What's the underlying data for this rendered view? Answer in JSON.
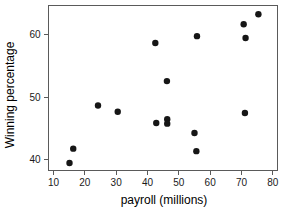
{
  "chart_data": {
    "type": "scatter",
    "title": "",
    "xlabel": "payroll (millions)",
    "ylabel": "Winning percentage",
    "xlim": [
      8.4,
      81.5
    ],
    "ylim": [
      38.3,
      64.7
    ],
    "xticks": [
      10,
      20,
      30,
      40,
      50,
      60,
      70,
      80
    ],
    "xtick_labels": [
      "10",
      "20",
      "30",
      "40",
      "50",
      "60",
      "70",
      "80"
    ],
    "yticks": [
      40,
      50,
      60
    ],
    "ytick_labels": [
      "40",
      "50",
      "60"
    ],
    "grid": false,
    "legend": null,
    "marker": "filled-circle",
    "marker_color": "#161616",
    "frame_color": "#5a5a5a",
    "x": [
      15.1,
      16.3,
      24.2,
      30.5,
      42.5,
      42.8,
      46.2,
      46.3,
      46.3,
      55.0,
      55.6,
      55.8,
      70.7,
      71.1,
      71.3,
      75.4
    ],
    "y": [
      39.5,
      41.8,
      48.7,
      47.7,
      58.7,
      45.9,
      52.6,
      46.5,
      45.8,
      44.3,
      41.4,
      59.8,
      61.7,
      47.5,
      59.5,
      63.3
    ],
    "points": [
      {
        "x": 15.1,
        "y": 39.5
      },
      {
        "x": 16.3,
        "y": 41.8
      },
      {
        "x": 24.2,
        "y": 48.7
      },
      {
        "x": 30.5,
        "y": 47.7
      },
      {
        "x": 42.5,
        "y": 58.7
      },
      {
        "x": 42.8,
        "y": 45.9
      },
      {
        "x": 46.2,
        "y": 52.6
      },
      {
        "x": 46.3,
        "y": 46.5
      },
      {
        "x": 46.3,
        "y": 45.8
      },
      {
        "x": 55.0,
        "y": 44.3
      },
      {
        "x": 55.6,
        "y": 41.4
      },
      {
        "x": 55.8,
        "y": 59.8
      },
      {
        "x": 70.7,
        "y": 61.7
      },
      {
        "x": 71.1,
        "y": 47.5
      },
      {
        "x": 71.3,
        "y": 59.5
      },
      {
        "x": 75.4,
        "y": 63.3
      }
    ]
  }
}
